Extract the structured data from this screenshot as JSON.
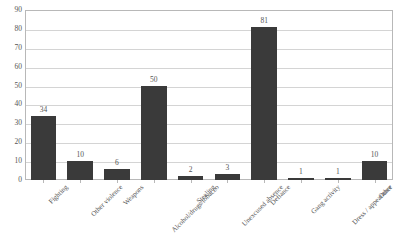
{
  "chart_data": {
    "type": "bar",
    "title": "",
    "xlabel": "",
    "ylabel": "",
    "ylim": [
      0,
      90
    ],
    "ytick_step": 10,
    "yticks": [
      90,
      80,
      70,
      60,
      50,
      40,
      30,
      20,
      10,
      0
    ],
    "grid": true,
    "legend": false,
    "bar_color": "#3a3a3a",
    "categories": [
      "Fighting",
      "Other violence",
      "Weapons",
      "Alcohol/drugs/tobacco",
      "Stealing",
      "Unexcused absence",
      "Defiance",
      "Gang activity",
      "Dress / appearance",
      "Other"
    ],
    "values": [
      34,
      10,
      6,
      50,
      2,
      3,
      81,
      1,
      1,
      10
    ],
    "data_labels": [
      "34",
      "10",
      "6",
      "50",
      "2",
      "3",
      "81",
      "1",
      "1",
      "10"
    ]
  }
}
